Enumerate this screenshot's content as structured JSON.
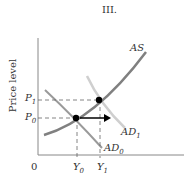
{
  "title": "III.",
  "axes": {
    "y_label": "Price level",
    "origin": "0"
  },
  "curves": {
    "as": "AS",
    "ad0": "AD",
    "ad0_sub": "0",
    "ad1": "AD",
    "ad1_sub": "1"
  },
  "ticks": {
    "p1": "P",
    "p1_sub": "1",
    "p0": "P",
    "p0_sub": "0",
    "y0": "Y",
    "y0_sub": "0",
    "y1": "Y",
    "y1_sub": "1"
  },
  "colors": {
    "as": "#808080",
    "ad0": "#9a9a9a",
    "ad1": "#c8c8c8",
    "axis": "#888888",
    "point": "#000000"
  }
}
